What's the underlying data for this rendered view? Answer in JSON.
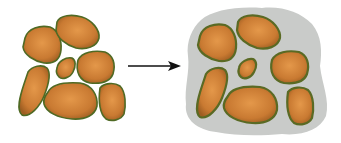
{
  "diagram": {
    "colors": {
      "particle_fill_inner": "#d98a3a",
      "particle_fill_outer": "#b06a28",
      "particle_outline": "#5a6a2a",
      "matrix_fill": "#c8cac8",
      "arrow": "#111111",
      "background": "#ffffff"
    },
    "left_group": {
      "label": "",
      "particle_count": 7
    },
    "arrow": {
      "direction": "right"
    },
    "right_group": {
      "label": "",
      "particle_count": 7,
      "has_matrix": true
    }
  }
}
